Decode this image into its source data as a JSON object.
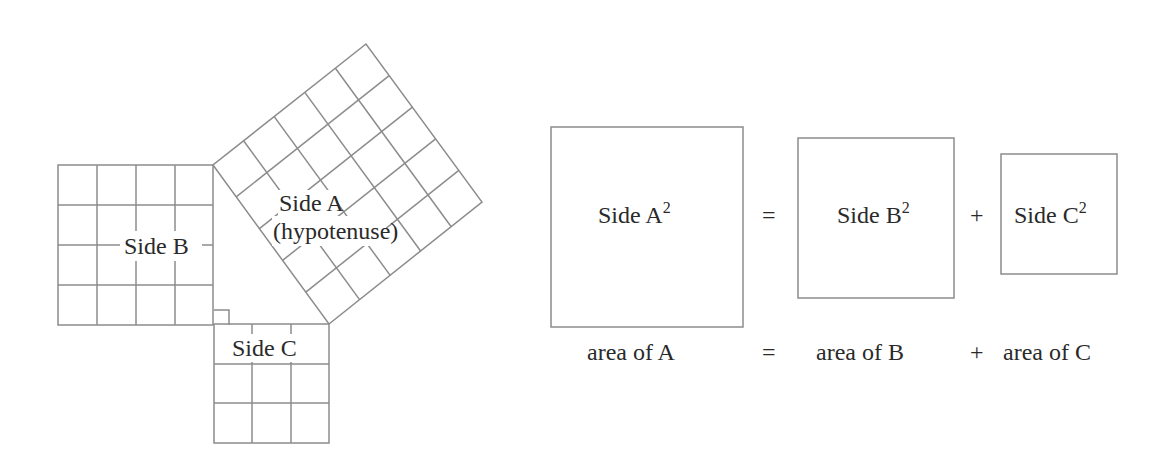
{
  "diagram": {
    "colors": {
      "line": "#8c8c8c",
      "text": "#2a2a2a",
      "background": "#ffffff"
    },
    "left_figure": {
      "square_b": {
        "label": "Side B",
        "grid": [
          4,
          4
        ]
      },
      "square_c": {
        "label": "Side C",
        "grid": [
          3,
          3
        ]
      },
      "square_a": {
        "label_line1": "Side A",
        "label_line2": "(hypotenuse)",
        "grid": [
          5,
          5
        ]
      },
      "right_angle_marker": true
    },
    "equation": {
      "box_a": {
        "label": "Side A",
        "exponent": "2"
      },
      "equals": "=",
      "box_b": {
        "label": "Side B",
        "exponent": "2"
      },
      "plus": "+",
      "box_c": {
        "label": "Side C",
        "exponent": "2"
      }
    },
    "caption": {
      "area_a": "area of A",
      "equals": "=",
      "area_b": "area of B",
      "plus": "+",
      "area_c": "area of C"
    }
  }
}
